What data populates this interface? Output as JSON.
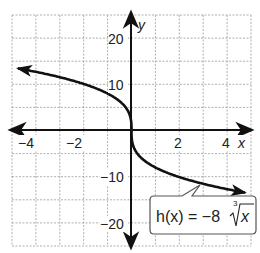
{
  "chart_data": {
    "type": "line",
    "title": "",
    "xlabel": "x",
    "ylabel": "y",
    "xlim": [
      -5,
      5
    ],
    "ylim": [
      -25,
      25
    ],
    "grid": true,
    "x_grid_step": 1,
    "y_grid_step": 5,
    "x_ticks": [
      -4,
      -2,
      2,
      4
    ],
    "x_tick_labels": [
      "−4",
      "−2",
      "2",
      "4"
    ],
    "y_ticks": [
      20,
      10,
      -10,
      -20
    ],
    "y_tick_labels": [
      "20",
      "10",
      "−10",
      "−20"
    ],
    "series": [
      {
        "name": "h(x) = −8∛x",
        "function": "h(x) = -8 * cbrt(x)",
        "x": [
          -5,
          -4,
          -3,
          -2,
          -1,
          -0.5,
          0,
          0.5,
          1,
          2,
          3,
          4,
          5
        ],
        "values": [
          13.68,
          12.7,
          11.54,
          10.08,
          8,
          6.35,
          0,
          -6.35,
          -8,
          -10.08,
          -11.54,
          -12.7,
          -13.68
        ],
        "color": "#111111",
        "arrows_both_ends": true
      }
    ],
    "annotations": [
      {
        "text_main": "h(x) = −8",
        "radical_index": "3",
        "radicand": "x",
        "points_to_x": 3.2
      }
    ]
  },
  "labels": {
    "x_axis": "x",
    "y_axis": "y",
    "x_ticks": [
      "−4",
      "−2",
      "2",
      "4"
    ],
    "y_ticks": [
      "20",
      "10",
      "−10",
      "−20"
    ],
    "formula_lhs": "h(x) = −8",
    "formula_index": "3",
    "formula_radicand": "x"
  }
}
